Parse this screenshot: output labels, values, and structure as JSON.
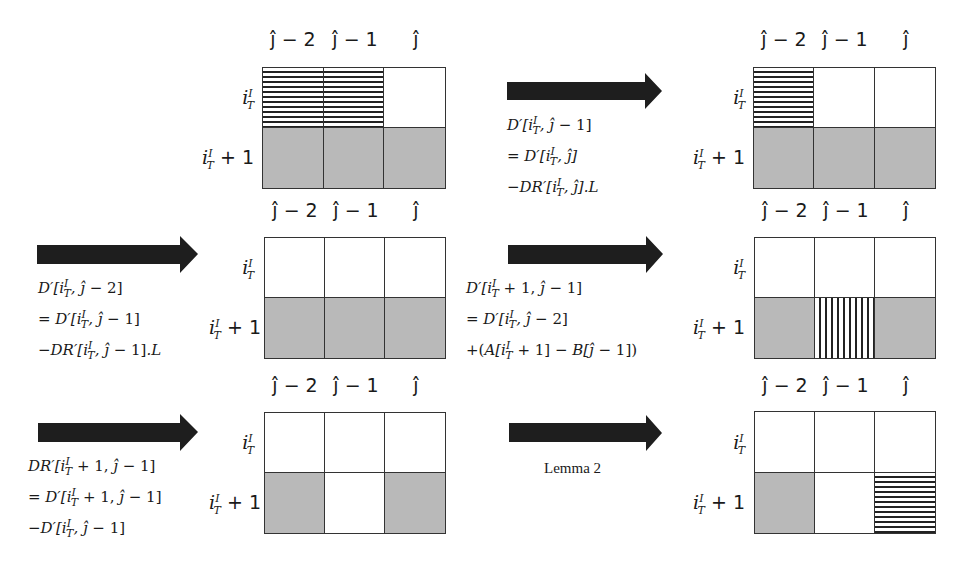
{
  "column_headers": [
    "ĵ − 2",
    "ĵ − 1",
    "ĵ"
  ],
  "row_labels": {
    "row1": "i",
    "row1_sup": "I",
    "row1_sub": "T",
    "row2_suffix": "+ 1"
  },
  "colors": {
    "gray_cell": "#b9b9b9",
    "stripe": "#222222",
    "arrow": "#1e1e1e",
    "border": "#333333"
  },
  "panels": [
    {
      "id": "p1",
      "cells": [
        [
          "hstripe",
          "hstripe",
          "white"
        ],
        [
          "gray",
          "gray",
          "gray"
        ]
      ]
    },
    {
      "id": "p2",
      "cells": [
        [
          "hstripe",
          "white",
          "white"
        ],
        [
          "gray",
          "gray",
          "gray"
        ]
      ]
    },
    {
      "id": "p3",
      "cells": [
        [
          "white",
          "white",
          "white"
        ],
        [
          "gray",
          "gray",
          "gray"
        ]
      ]
    },
    {
      "id": "p4",
      "cells": [
        [
          "white",
          "white",
          "white"
        ],
        [
          "gray",
          "vstripe",
          "gray"
        ]
      ]
    },
    {
      "id": "p5",
      "cells": [
        [
          "white",
          "white",
          "white"
        ],
        [
          "gray",
          "white",
          "gray"
        ]
      ]
    },
    {
      "id": "p6",
      "cells": [
        [
          "white",
          "white",
          "white"
        ],
        [
          "gray",
          "white",
          "hstripe"
        ]
      ]
    }
  ],
  "transitions": [
    {
      "id": "t1",
      "lines": [
        "D′[i_T^I, ĵ − 1]",
        "= D′[i_T^I, ĵ]",
        "−DR′[i_T^I, ĵ].L"
      ]
    },
    {
      "id": "t2",
      "lines": [
        "D′[i_T^I, ĵ − 2]",
        "= D′[i_T^I, ĵ − 1]",
        "−DR′[i_T^I, ĵ − 1].L"
      ]
    },
    {
      "id": "t3",
      "lines": [
        "D′[i_T^I + 1, ĵ − 1]",
        "= D′[i_T^I, ĵ − 2]",
        "+(A[i_T^I + 1] − B[ĵ − 1])"
      ]
    },
    {
      "id": "t4",
      "lines": [
        "DR′[i_T^I + 1, ĵ − 1]",
        "= D′[i_T^I + 1, ĵ − 1]",
        "−D′[i_T^I, ĵ − 1]"
      ]
    },
    {
      "id": "t5",
      "label": "Lemma 2"
    }
  ]
}
